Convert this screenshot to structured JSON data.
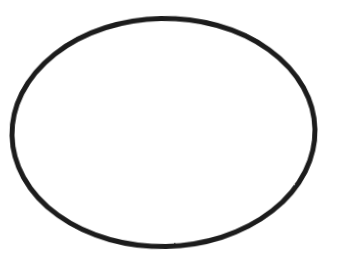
{
  "canvas": {
    "width": 343,
    "height": 259,
    "background_color": "#ffffff",
    "description": "Single black ellipse outline on a plain white background"
  },
  "figure": {
    "name": "ellipse-outline",
    "shape_type": "ellipse",
    "stroke_color": "#1c1c1c",
    "stroke_width": 5,
    "fill_color": "none",
    "center_x": 163.5,
    "center_y": 132.5,
    "radius_x": 151.5,
    "radius_y": 114.0,
    "rotation_degrees": -1.2,
    "bounding_box": {
      "left": 11,
      "top": 18,
      "right": 316,
      "bottom": 247
    },
    "texture": "slightly rough scanned ink line"
  },
  "labels": {
    "title": "",
    "caption": "",
    "annotations": []
  }
}
